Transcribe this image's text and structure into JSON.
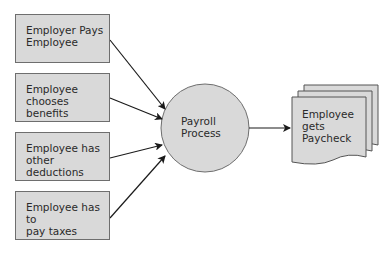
{
  "diagram": {
    "inputs": [
      {
        "label_line1": "Employer Pays",
        "label_line2": "Employee"
      },
      {
        "label_line1": "Employee",
        "label_line2": "chooses benefits"
      },
      {
        "label_line1": "Employee has",
        "label_line2": "other deductions"
      },
      {
        "label_line1": "Employee has to",
        "label_line2": "pay taxes"
      }
    ],
    "process": {
      "label_line1": "Payroll",
      "label_line2": "Process"
    },
    "output": {
      "label_line1": "Employee",
      "label_line2": "gets",
      "label_line3": "Paycheck"
    },
    "colors": {
      "fill": "#d9d9d9",
      "stroke": "#6e6e6e",
      "arrow": "#1a1a1a",
      "text": "#2a2a2a"
    }
  }
}
